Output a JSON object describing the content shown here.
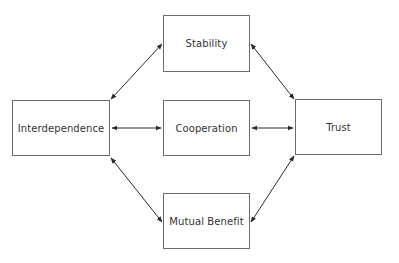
{
  "diagram": {
    "type": "concept-map",
    "line_color": "#2a2a2a",
    "box_border_color": "#6b6b6b",
    "text_color": "#333333",
    "nodes": [
      {
        "id": "stability",
        "label": "Stability",
        "x": 163,
        "y": 15,
        "w": 87,
        "h": 57
      },
      {
        "id": "interdependence",
        "label": "Interdependence",
        "x": 12,
        "y": 100,
        "w": 98,
        "h": 56
      },
      {
        "id": "cooperation",
        "label": "Cooperation",
        "x": 163,
        "y": 100,
        "w": 87,
        "h": 56
      },
      {
        "id": "trust",
        "label": "Trust",
        "x": 295,
        "y": 99,
        "w": 87,
        "h": 56
      },
      {
        "id": "mutual-benefit",
        "label": "Mutual Benefit",
        "x": 163,
        "y": 193,
        "w": 87,
        "h": 56
      }
    ],
    "edges": [
      {
        "from": "interdependence",
        "to": "stability",
        "bidirectional": true
      },
      {
        "from": "interdependence",
        "to": "cooperation",
        "bidirectional": true
      },
      {
        "from": "interdependence",
        "to": "mutual-benefit",
        "bidirectional": true
      },
      {
        "from": "stability",
        "to": "trust",
        "bidirectional": true
      },
      {
        "from": "cooperation",
        "to": "trust",
        "bidirectional": true
      },
      {
        "from": "mutual-benefit",
        "to": "trust",
        "bidirectional": true
      }
    ]
  }
}
